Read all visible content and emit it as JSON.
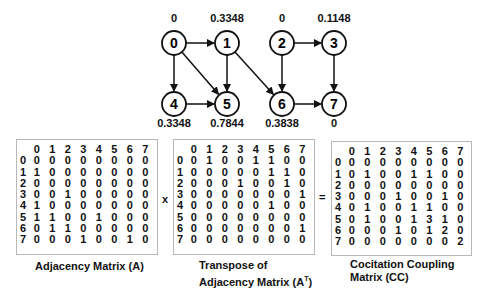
{
  "graph": {
    "nodes": [
      {
        "id": "0",
        "x": 174,
        "y": 43,
        "score": "0",
        "label_pos": "above"
      },
      {
        "id": "1",
        "x": 227,
        "y": 43,
        "score": "0.3348",
        "label_pos": "above"
      },
      {
        "id": "2",
        "x": 282,
        "y": 43,
        "score": "0",
        "label_pos": "above"
      },
      {
        "id": "3",
        "x": 334,
        "y": 43,
        "score": "0.1148",
        "label_pos": "above"
      },
      {
        "id": "4",
        "x": 174,
        "y": 104,
        "score": "0.3348",
        "label_pos": "below"
      },
      {
        "id": "5",
        "x": 227,
        "y": 104,
        "score": "0.7844",
        "label_pos": "below"
      },
      {
        "id": "6",
        "x": 282,
        "y": 104,
        "score": "0.3838",
        "label_pos": "below"
      },
      {
        "id": "7",
        "x": 334,
        "y": 104,
        "score": "0",
        "label_pos": "below"
      }
    ],
    "edges": [
      [
        "0",
        "1"
      ],
      [
        "0",
        "4"
      ],
      [
        "0",
        "5"
      ],
      [
        "1",
        "5"
      ],
      [
        "1",
        "6"
      ],
      [
        "4",
        "5"
      ],
      [
        "2",
        "3"
      ],
      [
        "2",
        "6"
      ],
      [
        "3",
        "7"
      ],
      [
        "6",
        "7"
      ]
    ]
  },
  "matrices": {
    "headers": [
      "0",
      "1",
      "2",
      "3",
      "4",
      "5",
      "6",
      "7"
    ],
    "A": {
      "caption": "Adjacency Matrix (A)",
      "rows": [
        [
          0,
          0,
          0,
          0,
          0,
          0,
          0,
          0
        ],
        [
          1,
          0,
          0,
          0,
          0,
          0,
          0,
          0
        ],
        [
          0,
          0,
          0,
          0,
          0,
          0,
          0,
          0
        ],
        [
          0,
          0,
          1,
          0,
          0,
          0,
          0,
          0
        ],
        [
          1,
          0,
          0,
          0,
          0,
          0,
          0,
          0
        ],
        [
          1,
          1,
          0,
          0,
          1,
          0,
          0,
          0
        ],
        [
          0,
          1,
          1,
          0,
          0,
          0,
          0,
          0
        ],
        [
          0,
          0,
          0,
          1,
          0,
          0,
          1,
          0
        ]
      ]
    },
    "AT": {
      "caption_line1": "Transpose of",
      "caption_line2": "Adjacency Matrix (A",
      "caption_sup": "T",
      "caption_end": ")",
      "rows": [
        [
          0,
          1,
          0,
          0,
          1,
          1,
          0,
          0
        ],
        [
          0,
          0,
          0,
          0,
          0,
          1,
          1,
          0
        ],
        [
          0,
          0,
          0,
          1,
          0,
          0,
          1,
          0
        ],
        [
          0,
          0,
          0,
          0,
          0,
          0,
          0,
          1
        ],
        [
          0,
          0,
          0,
          0,
          0,
          1,
          0,
          0
        ],
        [
          0,
          0,
          0,
          0,
          0,
          0,
          0,
          0
        ],
        [
          0,
          0,
          0,
          0,
          0,
          0,
          0,
          1
        ],
        [
          0,
          0,
          0,
          0,
          0,
          0,
          0,
          0
        ]
      ]
    },
    "CC": {
      "caption_line1": "Cocitation Coupling",
      "caption_line2": "Matrix (CC)",
      "rows": [
        [
          0,
          0,
          0,
          0,
          0,
          0,
          0,
          0
        ],
        [
          0,
          1,
          0,
          0,
          1,
          1,
          0,
          0
        ],
        [
          0,
          0,
          0,
          0,
          0,
          0,
          0,
          0
        ],
        [
          0,
          0,
          0,
          1,
          0,
          0,
          1,
          0
        ],
        [
          0,
          1,
          0,
          0,
          1,
          1,
          0,
          0
        ],
        [
          0,
          1,
          0,
          0,
          1,
          3,
          1,
          0
        ],
        [
          0,
          0,
          0,
          1,
          0,
          1,
          2,
          0
        ],
        [
          0,
          0,
          0,
          0,
          0,
          0,
          0,
          2
        ]
      ]
    }
  },
  "operators": {
    "multiply": "x",
    "equals": "="
  }
}
